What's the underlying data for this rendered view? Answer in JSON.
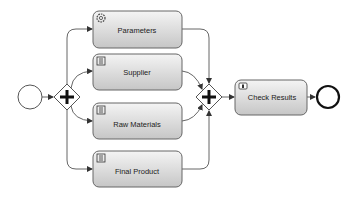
{
  "diagram": {
    "type": "BPMN process",
    "start_event": {
      "label": ""
    },
    "split_gateway": {
      "kind": "parallel",
      "symbol": "+"
    },
    "join_gateway": {
      "kind": "parallel",
      "symbol": "+"
    },
    "tasks": [
      {
        "label": "Parameters",
        "icon": "gear-icon",
        "type": "service"
      },
      {
        "label": "Supplier",
        "icon": "script-icon",
        "type": "script"
      },
      {
        "label": "Raw Materials",
        "icon": "script-icon",
        "type": "script"
      },
      {
        "label": "Final Product",
        "icon": "script-icon",
        "type": "script"
      }
    ],
    "final_task": {
      "label": "Check Results",
      "icon": "user-icon",
      "type": "user"
    },
    "end_event": {
      "label": ""
    },
    "colors": {
      "task_fill_top": "#f2f2f2",
      "task_fill_bottom": "#c8c8c8",
      "stroke": "#555555",
      "end_stroke": "#111111"
    }
  }
}
